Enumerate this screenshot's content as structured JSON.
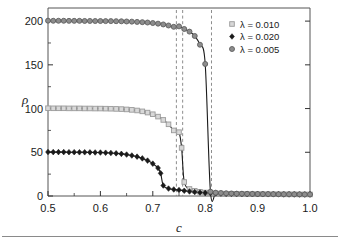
{
  "chart_data": {
    "type": "scatter",
    "title": "",
    "subtitle": "",
    "xlabel": "c",
    "ylabel": "ρ",
    "xlim": [
      0.5,
      1.0
    ],
    "ylim": [
      0,
      215
    ],
    "grid": false,
    "legend_position": "top-right",
    "x_ticks": [
      0.5,
      0.6,
      0.7,
      0.8,
      0.9,
      1.0
    ],
    "x_tick_labels": [
      "0.5",
      "0.6",
      "0.7",
      "0.8",
      "0.9",
      "1.0"
    ],
    "x_minor_ticks": [
      0.55,
      0.65,
      0.75,
      0.85,
      0.95
    ],
    "y_ticks": [
      0,
      50,
      100,
      150,
      200
    ],
    "y_tick_labels": [
      "0",
      "50",
      "100",
      "150",
      "200"
    ],
    "y_minor_ticks": [
      25,
      75,
      125,
      175
    ],
    "annotations": [
      {
        "name": "spinodal-line-1",
        "x": 0.745,
        "label": ""
      },
      {
        "name": "spinodal-line-2",
        "x": 0.757,
        "label": ""
      },
      {
        "name": "spinodal-line-3",
        "x": 0.812,
        "label": ""
      }
    ],
    "series": [
      {
        "name": "lambda-0.010",
        "legend_label": "λ = 0.010",
        "marker": "open-square",
        "marker_color": "#9a9a9a",
        "marker_fill": "#d8d8d8",
        "plateau": 100,
        "x": [
          0.5,
          0.51,
          0.52,
          0.53,
          0.54,
          0.55,
          0.56,
          0.57,
          0.58,
          0.59,
          0.6,
          0.61,
          0.62,
          0.63,
          0.64,
          0.65,
          0.66,
          0.67,
          0.68,
          0.69,
          0.7,
          0.71,
          0.72,
          0.73,
          0.74,
          0.75,
          0.755,
          0.76,
          0.77,
          0.78,
          0.79,
          0.8,
          0.81,
          0.82,
          0.83,
          0.84,
          0.85,
          0.86,
          0.87,
          0.88,
          0.89,
          0.9,
          0.91,
          0.92,
          0.93,
          0.94,
          0.95,
          0.96,
          0.97,
          0.98,
          0.99,
          1.0
        ],
        "y": [
          100.4,
          100.3,
          100.3,
          100.3,
          100.2,
          100.2,
          100.2,
          100.1,
          100.1,
          100.0,
          100.0,
          99.9,
          99.8,
          99.6,
          99.4,
          99.0,
          98.5,
          97.8,
          96.8,
          95.4,
          93.5,
          90.8,
          87.0,
          82.0,
          75.0,
          73.0,
          55.0,
          16.0,
          8.0,
          6.0,
          4.8,
          4.0,
          3.4,
          3.0,
          2.8,
          2.6,
          2.5,
          2.4,
          2.3,
          2.2,
          2.2,
          2.1,
          2.1,
          2.0,
          2.0,
          2.0,
          1.9,
          1.9,
          1.9,
          1.8,
          1.8,
          1.8
        ]
      },
      {
        "name": "lambda-0.020",
        "legend_label": "λ = 0.020",
        "marker": "filled-diamond",
        "marker_color": "#1a1a1a",
        "marker_fill": "#1a1a1a",
        "plateau": 50,
        "x": [
          0.5,
          0.51,
          0.52,
          0.53,
          0.54,
          0.55,
          0.56,
          0.57,
          0.58,
          0.59,
          0.6,
          0.61,
          0.62,
          0.63,
          0.64,
          0.65,
          0.66,
          0.67,
          0.68,
          0.69,
          0.7,
          0.71,
          0.715,
          0.72,
          0.73,
          0.74,
          0.75,
          0.76,
          0.77,
          0.78,
          0.79,
          0.8,
          0.81,
          0.82,
          0.83,
          0.84,
          0.85,
          0.86,
          0.87,
          0.88,
          0.89,
          0.9,
          0.91,
          0.92,
          0.93,
          0.94,
          0.95,
          0.96,
          0.97,
          0.98,
          0.99,
          1.0
        ],
        "y": [
          50.3,
          50.2,
          50.2,
          50.2,
          50.1,
          50.1,
          50.0,
          50.0,
          49.9,
          49.8,
          49.7,
          49.5,
          49.2,
          48.8,
          48.2,
          47.4,
          46.3,
          45.0,
          43.0,
          40.5,
          37.0,
          32.0,
          26.0,
          12.0,
          8.5,
          7.5,
          6.8,
          6.0,
          5.2,
          4.5,
          4.0,
          3.6,
          3.3,
          3.0,
          2.8,
          2.6,
          2.5,
          2.4,
          2.3,
          2.2,
          2.2,
          2.1,
          2.1,
          2.0,
          2.0,
          2.0,
          1.9,
          1.9,
          1.9,
          1.8,
          1.8,
          1.8
        ]
      },
      {
        "name": "lambda-0.005",
        "legend_label": "λ = 0.005",
        "marker": "filled-circle",
        "marker_color": "#5f5f5f",
        "marker_fill": "#8d8d8d",
        "plateau": 200,
        "x": [
          0.5,
          0.51,
          0.52,
          0.53,
          0.54,
          0.55,
          0.56,
          0.57,
          0.58,
          0.59,
          0.6,
          0.61,
          0.62,
          0.63,
          0.64,
          0.65,
          0.66,
          0.67,
          0.68,
          0.69,
          0.7,
          0.71,
          0.72,
          0.73,
          0.74,
          0.75,
          0.76,
          0.77,
          0.78,
          0.79,
          0.8,
          0.81,
          0.82,
          0.83,
          0.84,
          0.85,
          0.86,
          0.87,
          0.88,
          0.89,
          0.9,
          0.91,
          0.92,
          0.93,
          0.94,
          0.95,
          0.96,
          0.97,
          0.98,
          0.99,
          1.0
        ],
        "y": [
          200.5,
          200.4,
          200.4,
          200.4,
          200.3,
          200.3,
          200.3,
          200.2,
          200.2,
          200.1,
          200.1,
          200.0,
          200.0,
          199.9,
          199.8,
          199.6,
          199.4,
          199.1,
          198.8,
          198.4,
          197.8,
          197.1,
          196.2,
          195.0,
          193.5,
          194.0,
          191.0,
          188.0,
          183.0,
          173.0,
          151.0,
          5.0,
          3.8,
          3.4,
          3.1,
          2.9,
          2.7,
          2.6,
          2.5,
          2.4,
          2.3,
          2.2,
          2.2,
          2.1,
          2.0,
          2.0,
          2.0,
          1.9,
          1.9,
          1.8,
          1.8
        ]
      }
    ]
  }
}
